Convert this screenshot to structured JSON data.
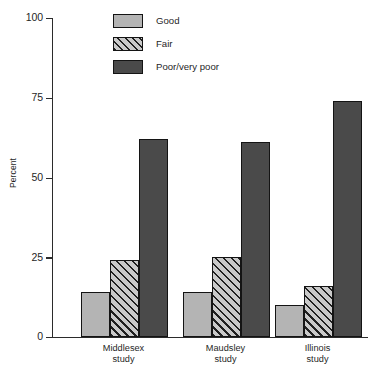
{
  "chart_data": {
    "type": "bar",
    "title": "",
    "subtitle": "",
    "xlabel": "",
    "ylabel": "Percent",
    "ylim": [
      0,
      100
    ],
    "yticks": [
      0,
      25,
      50,
      75,
      100
    ],
    "ytick_labels": [
      "0",
      "25",
      "50",
      "75",
      "100"
    ],
    "grid": false,
    "legend_position": "top-center",
    "categories": [
      "Middlesex study",
      "Maudsley study",
      "Illinois study"
    ],
    "category_lines": [
      [
        "Middlesex",
        "study"
      ],
      [
        "Maudsley",
        "study"
      ],
      [
        "Illinois",
        "study"
      ]
    ],
    "series": [
      {
        "name": "Good",
        "values": [
          14,
          14,
          10
        ],
        "color": "#b4b4b4",
        "pattern": "solid"
      },
      {
        "name": "Fair",
        "values": [
          24,
          25,
          16
        ],
        "color": "#c9c9c9",
        "pattern": "diagonal-hatch"
      },
      {
        "name": "Poor/very poor",
        "values": [
          62,
          61,
          74
        ],
        "color": "#4a4a4a",
        "pattern": "solid"
      }
    ]
  },
  "legend": {
    "items": [
      {
        "label": "Good"
      },
      {
        "label": "Fair"
      },
      {
        "label": "Poor/very poor"
      }
    ]
  },
  "axis": {
    "y_title": "Percent",
    "y_tick_labels": [
      "100",
      "75",
      "50",
      "25",
      "0"
    ]
  },
  "colors": {
    "good": "#b4b4b4",
    "fair": "#c9c9c9",
    "poor": "#4a4a4a",
    "axis": "#2b2b2b",
    "outline": "#141414",
    "background": "#ffffff"
  }
}
